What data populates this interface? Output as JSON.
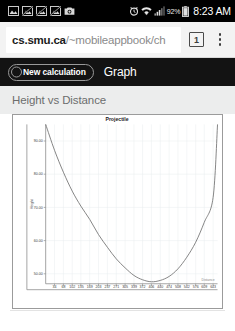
{
  "statusbar": {
    "icons": [
      "image-icon",
      "broken-image-icon",
      "broken-image-icon",
      "broken-image-icon",
      "camera-icon",
      "alarm-icon",
      "wifi-icon",
      "signal-icon",
      "battery-icon"
    ],
    "battery_percent": "92%",
    "time": "8:23 AM"
  },
  "browser": {
    "url_host": "cs.smu.ca",
    "url_path": "/~mobileappbook/ch",
    "url_full": "cs.smu.ca/~mobileappbook/ch",
    "url_placeholder": "Search or type URL",
    "tab_count": "1",
    "menu_icon": "overflow-menu-icon"
  },
  "appbar": {
    "new_calculation_label": "New calculation",
    "graph_tab_label": "Graph",
    "radio_icon": "radio-button-icon"
  },
  "page": {
    "heading": "Height vs Distance"
  },
  "colors": {
    "statusbar_bg": "#000000",
    "urlbar_bg": "#f3f3f3",
    "appbar_bg": "#131313",
    "pagehead_bg": "#eceded",
    "card_border": "#9b9b9b",
    "curve": "#6f6f6f",
    "gridline": "#e8ecef"
  },
  "chart_data": {
    "type": "line",
    "title": "Projectile",
    "xlabel": "Distance",
    "ylabel": "Height",
    "grid": "vertical-major-and-horizontal-minor",
    "legend": "none",
    "yticks": [
      "50.00",
      "60.00",
      "70.00",
      "80.00",
      "90.00"
    ],
    "ylim": [
      95,
      47
    ],
    "y_inverted": true,
    "xticks": [
      "34",
      "68",
      "102",
      "135",
      "169",
      "203",
      "237",
      "271",
      "305",
      "339",
      "372",
      "406",
      "440",
      "474",
      "508",
      "542",
      "576",
      "609",
      "643"
    ],
    "xlim": [
      0,
      660
    ],
    "x": [
      0,
      34,
      68,
      102,
      135,
      169,
      203,
      237,
      271,
      305,
      339,
      372,
      406,
      440,
      474,
      508,
      542,
      576,
      609,
      643,
      660
    ],
    "y": [
      95.0,
      87.2,
      80.6,
      74.9,
      70.4,
      66.4,
      61.8,
      58.0,
      54.5,
      51.8,
      49.5,
      48.2,
      47.6,
      48.0,
      49.2,
      51.5,
      55.0,
      59.5,
      65.5,
      73.0,
      95.0
    ],
    "series": [
      {
        "name": "Projectile",
        "values": [
          95.0,
          87.2,
          80.6,
          74.9,
          70.4,
          66.4,
          61.8,
          58.0,
          54.5,
          51.8,
          49.5,
          48.2,
          47.6,
          48.0,
          49.2,
          51.5,
          55.0,
          59.5,
          65.5,
          73.0,
          95.0
        ]
      }
    ]
  }
}
